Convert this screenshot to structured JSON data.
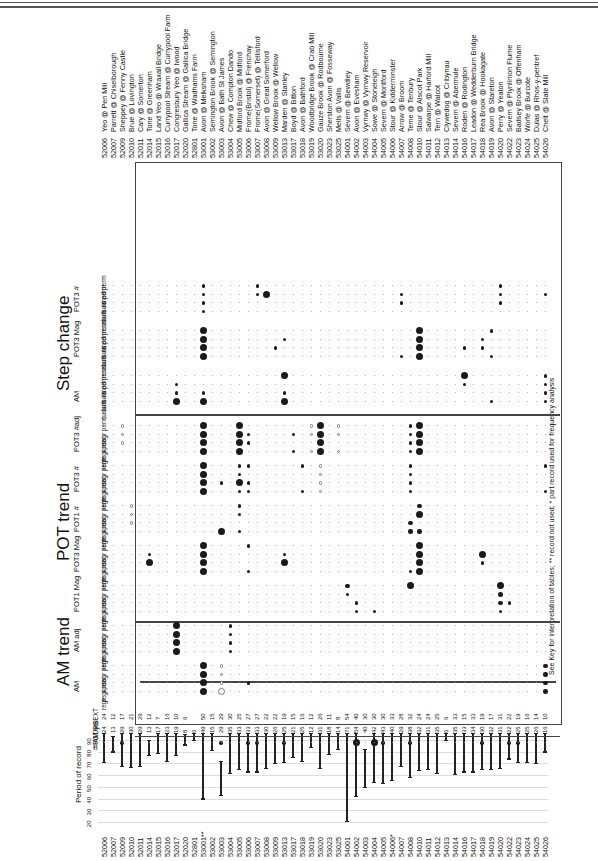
{
  "page": {
    "footnote": "See Key for interpretation of tables; ** record not used; * part record used for frequency analysis"
  },
  "sections": {
    "am_trend": "AM trend",
    "pot_trend": "POT trend",
    "step_change": "Step change"
  },
  "groups": {
    "am": "AM",
    "am_adj": "AM adj",
    "pot1_mag": "POT1 Mag",
    "pot3_mag": "POT3 Mag",
    "pot1_num": "POT1 #",
    "pot3_num": "POT3 #",
    "pot3_adj": "POT3 #adj",
    "sc_am": "AM",
    "sc_pot3_mag": "POT3 Mag",
    "sc_pot3_num": "POT3 #"
  },
  "row_labels": {
    "trend": [
      "regr",
      "regr ns",
      "spear",
      "regr perm"
    ],
    "step": [
      "cusum",
      "buis ns",
      "buis perm",
      "med perm"
    ]
  },
  "meta_rows": {
    "urbext": "URBEXT",
    "pot_yrs": "# POT yrs",
    "am_count": "# AM",
    "period": "Period of record"
  },
  "axis": {
    "period_ticks": [
      "20",
      "30",
      "40",
      "50",
      "60",
      "70",
      "80",
      "90"
    ]
  },
  "stations": [
    {
      "code": "52006",
      "name": "Yeo @ Pen Mill",
      "am": "24",
      "pot": "24"
    },
    {
      "code": "52007",
      "name": "Parrett @ Chiselborough",
      "am": "13",
      "pot": "12"
    },
    {
      "code": "52009",
      "name": "Sheppey @ Fenny Castle",
      "am": "29",
      "pot": "17"
    },
    {
      "code": "52010",
      "name": "Brue @ Lovington",
      "am": "30",
      "pot": "21"
    },
    {
      "code": "52011",
      "name": "Cary @ Somerton",
      "am": "29",
      "pot": "29"
    },
    {
      "code": "52014",
      "name": "Tone @ Greenham",
      "am": "13",
      "pot": "12"
    },
    {
      "code": "52015",
      "name": "Land Yeo @ Wraxall Bridge",
      "am": "17",
      "pot": "7"
    },
    {
      "code": "52016",
      "name": "Currypool Stream @ Currypool Farm",
      "am": "23",
      "pot": "16"
    },
    {
      "code": "52017",
      "name": "Congresbury Yeo @ Iwood",
      "am": "19",
      "pot": "10"
    },
    {
      "code": "52020",
      "name": "Gallica Stream @ Gallica Bridge",
      "am": "8",
      "pot": "6"
    },
    {
      "code": "52801",
      "name": "Tone @ Wadhams Farm",
      "am": "6",
      "pot": ""
    },
    {
      "code": "53001",
      "name": "Avon @ Melksham",
      "am": "49",
      "pot": "50",
      "flag": "**"
    },
    {
      "code": "53002",
      "name": "Semington Brook @ Semington",
      "am": "15",
      "pot": "15"
    },
    {
      "code": "53003",
      "name": "Avon @ Bath St James",
      "am": "29",
      "pot": "29"
    },
    {
      "code": "53004",
      "name": "Chew @ Compton Dando",
      "am": "35",
      "pot": "30"
    },
    {
      "code": "53005",
      "name": "Midford Brook @ Midford",
      "am": "33",
      "pot": "25"
    },
    {
      "code": "53006",
      "name": "Frome(Bristol) @ Frenchay",
      "am": "33",
      "pot": "27"
    },
    {
      "code": "53007",
      "name": "Frome(Somerset) @ Tellisford",
      "am": "33",
      "pot": "27"
    },
    {
      "code": "53008",
      "name": "Avon @ Great Somerford",
      "am": "30",
      "pot": "22"
    },
    {
      "code": "53009",
      "name": "Wellow Brook @ Wellow",
      "am": "26",
      "pot": "22"
    },
    {
      "code": "53013",
      "name": "Marden @ Stanley",
      "am": "25",
      "pot": "19"
    },
    {
      "code": "53017",
      "name": "Boyd @ Bitton",
      "am": "21",
      "pot": "15"
    },
    {
      "code": "53018",
      "name": "Avon @ Bathford",
      "am": "25",
      "pot": "16"
    },
    {
      "code": "53019",
      "name": "Woodbridge Brook @ Crab Mill",
      "am": "12",
      "pot": "12"
    },
    {
      "code": "53020",
      "name": "Gauze Brook @ Rodbourne",
      "am": "31",
      "pot": "26"
    },
    {
      "code": "53023",
      "name": "Sherston Avon @ Fosseway",
      "am": "18",
      "pot": "11"
    },
    {
      "code": "53025",
      "name": "Mells @ Vallis",
      "am": "14",
      "pot": "8"
    },
    {
      "code": "54001",
      "name": "Severn @ Bewdley",
      "am": "71",
      "pot": "54"
    },
    {
      "code": "54002",
      "name": "Avon @ Evesham",
      "am": "54",
      "pot": "40"
    },
    {
      "code": "54003",
      "name": "Vyrnwy @ Vyrnwy Reservoir",
      "am": "40",
      "pot": "30"
    },
    {
      "code": "54004",
      "name": "Sowe @ Stoneleigh",
      "am": "42",
      "pot": "30"
    },
    {
      "code": "54005",
      "name": "Severn @ Montford",
      "am": "43",
      "pot": "30"
    },
    {
      "code": "54006",
      "name": "Stour @ Kidderminster",
      "am": "40",
      "pot": "33",
      "flag": "*"
    },
    {
      "code": "54007",
      "name": "Arrow @ Broom",
      "am": "29",
      "pot": "28"
    },
    {
      "code": "54008",
      "name": "Teme @ Tenbury",
      "am": "38",
      "pot": "32"
    },
    {
      "code": "54010",
      "name": "Stour @ Alscot Park",
      "am": "32",
      "pot": "24"
    },
    {
      "code": "54011",
      "name": "Salwarpe @ Harford Mill",
      "am": "31",
      "pot": "24"
    },
    {
      "code": "54012",
      "name": "Tern @ Walcot",
      "am": "35",
      "pot": "25"
    },
    {
      "code": "54013",
      "name": "Clywedog @ Cribynau",
      "am": "6",
      "pot": "6"
    },
    {
      "code": "54014",
      "name": "Severn @ Abermule",
      "am": "35",
      "pot": "33"
    },
    {
      "code": "54016",
      "name": "Roden @ Rodington",
      "am": "33",
      "pot": "15"
    },
    {
      "code": "54017",
      "name": "Leadon @ Wedderburn Bridge",
      "am": "34",
      "pot": "33"
    },
    {
      "code": "54018",
      "name": "Rea Brook @ Hookagate",
      "am": "30",
      "pot": "19"
    },
    {
      "code": "54019",
      "name": "Avon @ Stareton",
      "am": "32",
      "pot": "17"
    },
    {
      "code": "54020",
      "name": "Perry @ Yeaton",
      "am": "31",
      "pot": "31"
    },
    {
      "code": "54022",
      "name": "Severn @ Plynlimon Flume",
      "am": "22",
      "pot": "22"
    },
    {
      "code": "54023",
      "name": "Badsey Brook @ Offenham",
      "am": "25",
      "pot": "19"
    },
    {
      "code": "54024",
      "name": "Worfe @ Burcote",
      "am": "25",
      "pot": "16"
    },
    {
      "code": "54025",
      "name": "Dulas @ Rhos-y-pentref",
      "am": "26",
      "pot": "14"
    },
    {
      "code": "54026",
      "name": "Chelt @ Slate Mill",
      "am": "16",
      "pot": "10"
    }
  ],
  "chart_data": {
    "type": "table",
    "columns": [
      "Station",
      "Period of record",
      "# AM",
      "# POT yrs",
      "URBEXT",
      "AM trend",
      "POT trend",
      "Step change"
    ],
    "period_axis": {
      "label": "Period of record",
      "ticks": [
        20,
        30,
        40,
        50,
        60,
        70,
        80,
        90
      ],
      "range": [
        1915,
        1995
      ]
    },
    "periods": [
      [
        71,
        96
      ],
      [
        80,
        93
      ],
      [
        68,
        96
      ],
      [
        67,
        96
      ],
      [
        68,
        96
      ],
      [
        77,
        90
      ],
      [
        79,
        96
      ],
      [
        72,
        96
      ],
      [
        77,
        96
      ],
      [
        86,
        95
      ],
      [
        90,
        96
      ],
      [
        40,
        96
      ],
      [
        81,
        96
      ],
      [
        43,
        72
      ],
      [
        62,
        96
      ],
      [
        65,
        96
      ],
      [
        63,
        96
      ],
      [
        63,
        96
      ],
      [
        66,
        96
      ],
      [
        70,
        96
      ],
      [
        71,
        96
      ],
      [
        75,
        96
      ],
      [
        72,
        96
      ],
      [
        84,
        96
      ],
      [
        66,
        96
      ],
      [
        78,
        96
      ],
      [
        82,
        96
      ],
      [
        21,
        96
      ],
      [
        42,
        96
      ],
      [
        50,
        82
      ],
      [
        54,
        96
      ],
      [
        53,
        96
      ],
      [
        56,
        96
      ],
      [
        68,
        96
      ],
      [
        58,
        96
      ],
      [
        64,
        96
      ],
      [
        65,
        96
      ],
      [
        62,
        96
      ],
      [
        90,
        96
      ],
      [
        61,
        96
      ],
      [
        63,
        96
      ],
      [
        63,
        96
      ],
      [
        65,
        96
      ],
      [
        65,
        96
      ],
      [
        66,
        96
      ],
      [
        74,
        96
      ],
      [
        71,
        96
      ],
      [
        71,
        96
      ],
      [
        70,
        96
      ],
      [
        80,
        96
      ]
    ]
  }
}
